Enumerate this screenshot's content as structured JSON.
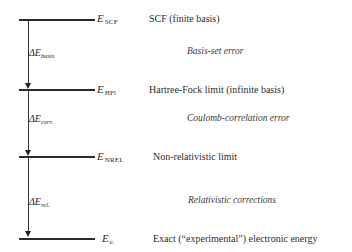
{
  "diagram": {
    "levels": [
      {
        "id": "scf",
        "symbol": "E",
        "subscript": "SCF",
        "description": "SCF  (finite basis)",
        "y": 20
      },
      {
        "id": "hfl",
        "symbol": "E",
        "subscript": "HFl",
        "description": "Hartree-Fock limit (infinite basis)",
        "y": 90
      },
      {
        "id": "nrel",
        "symbol": "E",
        "subscript": "NREL",
        "description": "Non-relativistic limit",
        "y": 157
      },
      {
        "id": "exact",
        "symbol": "E",
        "subscript": "e.",
        "description": "Exact (“experimental”) electronic energy",
        "y": 239
      }
    ],
    "differences": [
      {
        "id": "basis",
        "delta": "ΔE",
        "subscript": "basis",
        "error_label": "Basis-set error",
        "from": "scf",
        "to": "hfl"
      },
      {
        "id": "corr",
        "delta": "ΔE",
        "subscript": "corr.",
        "error_label": "Coulomb-correlation  error",
        "from": "hfl",
        "to": "nrel"
      },
      {
        "id": "rel",
        "delta": "ΔE",
        "subscript": "rel.",
        "error_label": "Relativistic corrections",
        "from": "nrel",
        "to": "exact"
      }
    ],
    "colors": {
      "line": "#2b2b2b",
      "text": "#2a2a2a",
      "background": "#ffffff"
    }
  }
}
